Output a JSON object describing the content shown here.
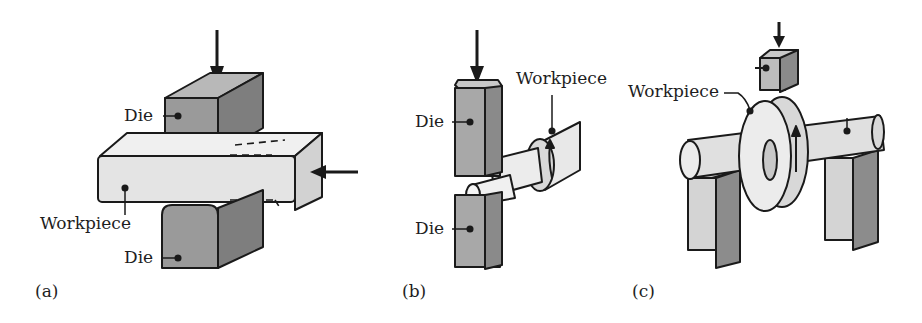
{
  "figure": {
    "panels": [
      {
        "id": "a",
        "caption": "(a)",
        "labels": {
          "die_top": "Die",
          "workpiece": "Workpiece",
          "die_bottom": "Die"
        }
      },
      {
        "id": "b",
        "caption": "(b)",
        "labels": {
          "workpiece": "Workpiece",
          "die_top": "Die",
          "die_bottom": "Die"
        }
      },
      {
        "id": "c",
        "caption": "(c)",
        "labels": {
          "workpiece": "Workpiece"
        }
      }
    ],
    "colors": {
      "die_front": "#9a9a9a",
      "die_side": "#7e7e7e",
      "die_top": "#b8b8b8",
      "workpiece_front": "#e4e4e4",
      "workpiece_top": "#f0f0f0",
      "workpiece_side": "#d2d2d2",
      "outline": "#1a1a1a"
    }
  }
}
